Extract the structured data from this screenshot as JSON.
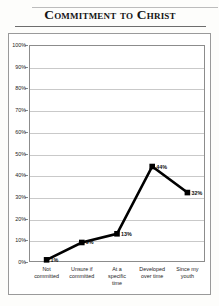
{
  "title": "Commitment to Christ",
  "chart_data": {
    "type": "line",
    "title": "Commitment to Christ",
    "xlabel": "",
    "ylabel": "",
    "categories": [
      "Not committed",
      "Unsure if committed",
      "At a specific time",
      "Developed over time",
      "Since my youth"
    ],
    "category_lines": [
      [
        "Not",
        "committed"
      ],
      [
        "Unsure if",
        "committed"
      ],
      [
        "At a",
        "specific",
        "time"
      ],
      [
        "Developed",
        "over time"
      ],
      [
        "Since my",
        "youth"
      ]
    ],
    "values": [
      1,
      9,
      13,
      44,
      32
    ],
    "point_labels": [
      "1%",
      "9%",
      "13%",
      "44%",
      "32%"
    ],
    "ylim": [
      0,
      100
    ],
    "y_ticks": [
      0,
      10,
      20,
      30,
      40,
      50,
      60,
      70,
      80,
      90,
      100
    ],
    "y_tick_labels": [
      "0%",
      "10%",
      "20%",
      "30%",
      "40%",
      "50%",
      "60%",
      "70%",
      "80%",
      "90%",
      "100%"
    ],
    "grid": true,
    "legend": false,
    "marker": "square",
    "series_color": "#000000",
    "grid_color": "#c9c9c9",
    "axis_color": "#8c8c8c"
  }
}
